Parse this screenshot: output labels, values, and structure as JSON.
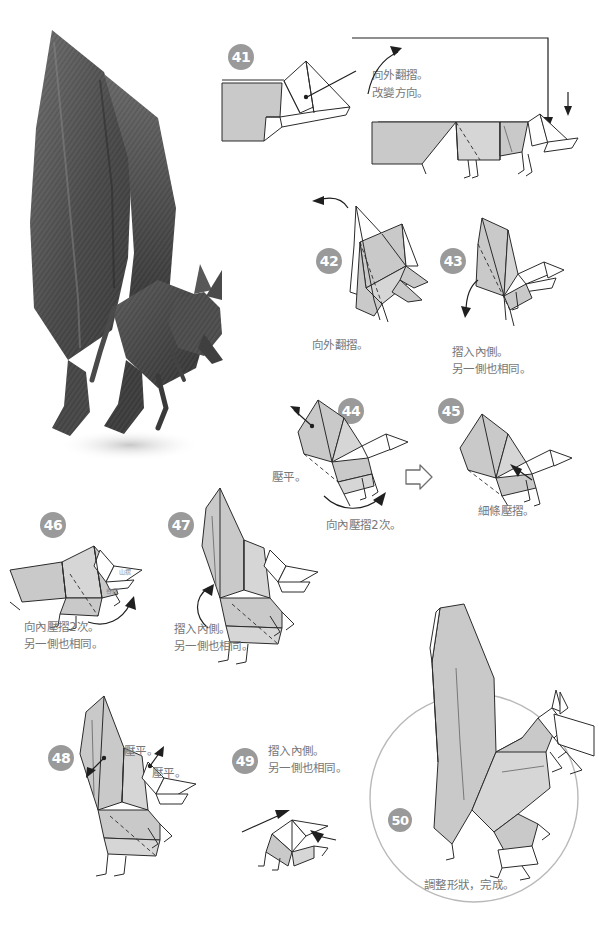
{
  "page": {
    "language": "zh-Hant",
    "width": 599,
    "height": 937,
    "badge_color": "#9a9a9a",
    "paper_color": "#c9c9c9",
    "line_color": "#2b2b2b",
    "caption_color": "#777777"
  },
  "photo": {
    "name": "finished-origami-bat-photo",
    "subject": "完成的蝙蝠摺紙作品",
    "tone": "dark-gray-textured-paper"
  },
  "steps": [
    {
      "number": "41",
      "captions": [
        "向外翻摺。",
        "改變方向。"
      ],
      "arrows": [
        "outside-reverse-fold-arrow",
        "change-direction-arrow"
      ]
    },
    {
      "number": "42",
      "captions": [
        "向外翻摺。"
      ],
      "arrows": [
        "outside-reverse-fold-arrow"
      ]
    },
    {
      "number": "43",
      "captions": [
        "摺入內側。",
        "另一側也相同。"
      ],
      "arrows": [
        "tuck-inside-arrow"
      ]
    },
    {
      "number": "44",
      "captions": [
        "壓平。",
        "向內壓摺2次。"
      ],
      "arrows": [
        "squash-pointer",
        "crimp-curve-arrow"
      ]
    },
    {
      "number": "45",
      "captions": [
        "細條壓摺。"
      ],
      "arrows": [
        "thin-strip-fold-pointer"
      ]
    },
    {
      "number": "46",
      "captions": [
        "向內壓摺2次。",
        "另一側也相同。"
      ],
      "small_labels": [
        "山摺",
        "谷摺"
      ],
      "arrows": [
        "inside-crimp-arrow"
      ]
    },
    {
      "number": "47",
      "captions": [
        "摺入內側。",
        "另一側也相同。"
      ],
      "arrows": [
        "tuck-inside-curve-arrow"
      ]
    },
    {
      "number": "48",
      "captions": [
        "壓平。",
        "壓平。"
      ],
      "arrows": [
        "squash-pointer-upper",
        "squash-pointer-lower"
      ]
    },
    {
      "number": "49",
      "captions": [
        "摺入內側。",
        "另一側也相同。"
      ],
      "arrows": [
        "tuck-inside-arrow"
      ]
    },
    {
      "number": "50",
      "captions": [
        "調整形狀，完成。"
      ],
      "highlight": "finished-model-circle"
    }
  ],
  "transition": {
    "name": "hollow-arrow-44-to-45",
    "glyph": "▷"
  }
}
